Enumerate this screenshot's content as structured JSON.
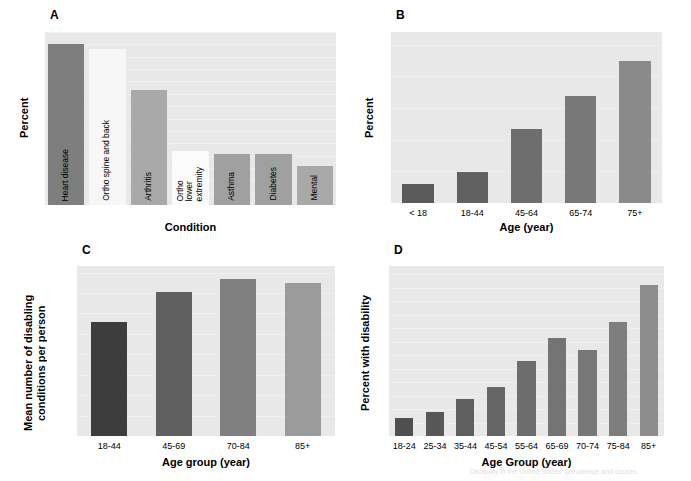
{
  "figure": {
    "background": "#ffffff",
    "plot_background": "#e8e8e8",
    "artifact_text": "Disability in the United States: prevalence and causes"
  },
  "panels": {
    "a": {
      "letter": "A",
      "ylabel": "Percent",
      "xlabel": "Condition"
    },
    "b": {
      "letter": "B",
      "ylabel": "Percent",
      "xlabel": "Age (year)"
    },
    "c": {
      "letter": "C",
      "ylabel": "Mean number of disabling\nconditions per person",
      "ylabel_line1": "Mean number of disabling",
      "ylabel_line2": "conditions per person",
      "xlabel": "Age group (year)"
    },
    "d": {
      "letter": "D",
      "ylabel": "Percent with disability",
      "xlabel": "Age Group (year)"
    }
  },
  "chart_data": [
    {
      "panel": "A",
      "type": "bar",
      "title": "",
      "xlabel": "Condition",
      "ylabel": "Percent",
      "ylim": [
        0,
        14
      ],
      "ytick_values": [
        0,
        1,
        2,
        3,
        4,
        5,
        6,
        7,
        8,
        9,
        10,
        11,
        12,
        13,
        14
      ],
      "ytick_labels": [
        "0",
        "1",
        "2",
        "3",
        "4",
        "5",
        "6",
        "7",
        "8",
        "9",
        "10",
        "11",
        "12",
        "13",
        "14"
      ],
      "grid": true,
      "legend": "none",
      "categories": [
        "Heart disease",
        "Ortho spine and back",
        "Arthritis",
        "Ortho lower extremity",
        "Asthma",
        "Diabetes",
        "Mental"
      ],
      "values": [
        13.0,
        12.6,
        9.3,
        4.4,
        4.1,
        4.1,
        3.2
      ],
      "bar_colors": [
        "#7e7e7e",
        "#f7f7f7",
        "#a9a9a9",
        "#fbfbfb",
        "#a0a0a0",
        "#a0a0a0",
        "#a8a8a8"
      ],
      "bar_label_lines": [
        [
          "Heart disease"
        ],
        [
          "Ortho spine and back"
        ],
        [
          "Arthritis"
        ],
        [
          "Ortho",
          "lower",
          "extremity"
        ],
        [
          "Asthma"
        ],
        [
          "Diabetes"
        ],
        [
          "Mental"
        ]
      ],
      "xtick_labels": []
    },
    {
      "panel": "B",
      "type": "bar",
      "title": "",
      "xlabel": "Age (year)",
      "ylabel": "Percent",
      "ylim": [
        0,
        54
      ],
      "ytick_values": [
        0,
        10,
        20,
        30,
        40,
        50
      ],
      "ytick_labels": [
        "0",
        "10",
        "20",
        "30",
        "40",
        "50"
      ],
      "grid": true,
      "legend": "none",
      "categories": [
        "< 18",
        "18-44",
        "45-64",
        "65-74",
        "75+"
      ],
      "values": [
        5.9,
        9.9,
        23.4,
        33.8,
        45.0
      ],
      "bar_colors": [
        "#5a5a5a",
        "#616161",
        "#6e6e6e",
        "#787878",
        "#8a8a8a"
      ]
    },
    {
      "panel": "C",
      "type": "bar",
      "title": "",
      "xlabel": "Age group (year)",
      "ylabel": "Mean number of disabling conditions per person",
      "ylim": [
        0,
        2.08
      ],
      "ytick_values": [
        0.0,
        0.25,
        0.5,
        0.75,
        1.0,
        1.25,
        1.5,
        1.75,
        2.0
      ],
      "ytick_labels": [
        "0.0",
        "",
        "0.5",
        "",
        "1.0",
        "",
        "1.5",
        "",
        "2.0"
      ],
      "grid": true,
      "legend": "none",
      "categories": [
        "18-44",
        "45-69",
        "70-84",
        "85+"
      ],
      "values": [
        1.39,
        1.76,
        1.92,
        1.87
      ],
      "bar_colors": [
        "#3d3d3d",
        "#606060",
        "#808080",
        "#9b9b9b"
      ]
    },
    {
      "panel": "D",
      "type": "bar",
      "title": "",
      "xlabel": "Age Group (year)",
      "ylabel": "Percent with disability",
      "ylim": [
        0,
        63
      ],
      "ytick_values": [
        0,
        5,
        10,
        15,
        20,
        25,
        30,
        35,
        40,
        45,
        50,
        55,
        60
      ],
      "ytick_labels": [
        "0",
        "",
        "10",
        "",
        "20",
        "",
        "30",
        "",
        "40",
        "",
        "50",
        "",
        "60"
      ],
      "grid": true,
      "legend": "none",
      "categories": [
        "18-24",
        "25-34",
        "35-44",
        "45-54",
        "55-64",
        "65-69",
        "70-74",
        "75-84",
        "85+"
      ],
      "values": [
        6.8,
        9.0,
        13.6,
        18.0,
        27.8,
        36.2,
        31.8,
        42.2,
        56.0
      ],
      "bar_colors": [
        "#505050",
        "#585858",
        "#5f5f5f",
        "#666666",
        "#6d6d6d",
        "#747474",
        "#787878",
        "#7e7e7e",
        "#8d8d8d"
      ]
    }
  ]
}
